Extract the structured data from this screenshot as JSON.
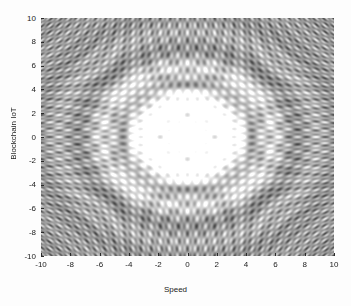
{
  "figure": {
    "background_color": "#fdfdfd",
    "width": 351,
    "height": 306
  },
  "axes": {
    "left": 41,
    "top": 18,
    "width": 293,
    "height": 238,
    "xlabel": "Speed",
    "ylabel": "Blockchain IoT",
    "xticklabels": [
      "-10",
      "-8",
      "-6",
      "-4",
      "-2",
      "0",
      "2",
      "4",
      "6",
      "8",
      "10"
    ],
    "yticklabels": [
      "10",
      "8",
      "6",
      "4",
      "2",
      "0",
      "-2",
      "-4",
      "-6",
      "-8",
      "-10"
    ]
  },
  "chart_data": {
    "type": "heatmap",
    "title": "",
    "xlabel": "Speed",
    "ylabel": "Blockchain IoT",
    "xlim": [
      -10,
      10
    ],
    "ylim": [
      -10,
      10
    ],
    "xticks": [
      -10,
      -8,
      -6,
      -4,
      -2,
      0,
      2,
      4,
      6,
      8,
      10
    ],
    "yticks": [
      -10,
      -8,
      -6,
      -4,
      -2,
      0,
      2,
      4,
      6,
      8,
      10
    ],
    "grid": false,
    "legend": "none",
    "colormap": "gray",
    "colormap_stops": [
      "#000000",
      "#ffffff"
    ],
    "value_range": [
      0,
      1
    ],
    "surface_formula": "z = cos(x*y) * sinc-like radial envelope; rendered as intensity = 0.5 + 0.5*cos(x*y)*exp(-r^2/90) combined with cos(x)*cos(y) lattice",
    "sample_grid": {
      "nx": 293,
      "ny": 238,
      "x_start": -10,
      "x_end": 10,
      "y_start": 10,
      "y_end": -10
    },
    "notable_features": [
      {
        "x": 0,
        "y": 0,
        "value": 0.95,
        "label": "bright central core"
      },
      {
        "x": 0,
        "y": 1.2,
        "value": 0.98,
        "label": "upper bright lobe"
      },
      {
        "x": 0,
        "y": -1.2,
        "value": 0.9,
        "label": "lower bright lobe"
      },
      {
        "x": -2,
        "y": 0,
        "value": 0.88,
        "label": "left bright node"
      },
      {
        "x": 2,
        "y": 0,
        "value": 0.88,
        "label": "right bright node"
      },
      {
        "x": -1.5,
        "y": 2.5,
        "value": 0.08,
        "label": "dark elliptical lobe"
      },
      {
        "x": 1.5,
        "y": 2.5,
        "value": 0.08,
        "label": "dark elliptical lobe"
      },
      {
        "x": -9,
        "y": 9,
        "value": 0.45,
        "label": "fine checkerboard corner"
      },
      {
        "x": 9,
        "y": -9,
        "value": 0.45,
        "label": "fine checkerboard corner"
      }
    ]
  }
}
